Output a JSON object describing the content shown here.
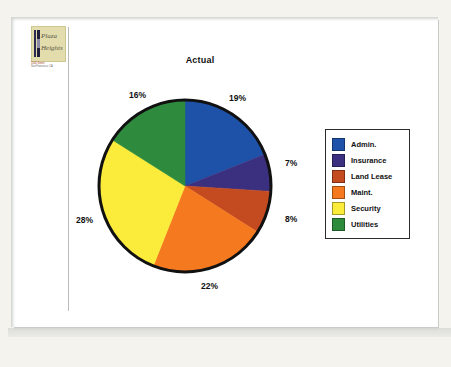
{
  "document": {
    "logo": {
      "word1": "Plaza",
      "word2": "Heights",
      "address_line1": "1000 Street",
      "address_line2": "San Francisco, CA"
    }
  },
  "legend": {
    "position": "right",
    "items": [
      {
        "label": "Admin.",
        "color": "#1d52a8"
      },
      {
        "label": "Insurance",
        "color": "#3b3080"
      },
      {
        "label": "Land Lease",
        "color": "#c44a20"
      },
      {
        "label": "Maint.",
        "color": "#f4791f"
      },
      {
        "label": "Security",
        "color": "#fbeb3b"
      },
      {
        "label": "Utilities",
        "color": "#2e8b3d"
      }
    ]
  },
  "chart_data": {
    "type": "pie",
    "title": "Actual",
    "xlabel": "",
    "ylabel": "",
    "categories": [
      "Admin.",
      "Insurance",
      "Land Lease",
      "Maint.",
      "Security",
      "Utilities"
    ],
    "values": [
      19,
      7,
      8,
      22,
      28,
      16
    ],
    "value_labels": [
      "19%",
      "7%",
      "8%",
      "22%",
      "28%",
      "16%"
    ],
    "colors": [
      "#1d52a8",
      "#3b3080",
      "#c44a20",
      "#f4791f",
      "#fbeb3b",
      "#2e8b3d"
    ],
    "units": "percent",
    "start_angle_deg": 0,
    "direction": "clockwise",
    "legend": true,
    "legend_position": "right",
    "grid": false,
    "outline_color": "#111111"
  },
  "colors": {
    "page_background": "#ffffff",
    "mat_background": "#f4f3ed",
    "divider": "#b9bcb8",
    "text": "#111111",
    "logo_background": "#e3dcad"
  }
}
